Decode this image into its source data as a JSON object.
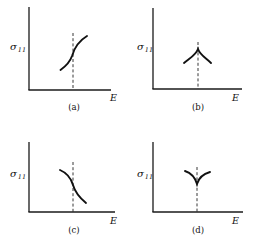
{
  "figure": {
    "panels": [
      {
        "id": "a",
        "caption": "(a)",
        "ylabel_symbol": "σ",
        "ylabel_sub": "11",
        "xlabel": "E",
        "shape": "monotonic increasing S-curve with inflection at dashed line"
      },
      {
        "id": "b",
        "caption": "(b)",
        "ylabel_symbol": "σ",
        "ylabel_sub": "11",
        "xlabel": "E",
        "shape": "peaked cusp (maximum) at dashed line"
      },
      {
        "id": "c",
        "caption": "(c)",
        "ylabel_symbol": "σ",
        "ylabel_sub": "11",
        "xlabel": "E",
        "shape": "monotonic decreasing S-curve with inflection at dashed line"
      },
      {
        "id": "d",
        "caption": "(d)",
        "ylabel_symbol": "σ",
        "ylabel_sub": "11",
        "xlabel": "E",
        "shape": "V-shaped cusp (minimum) at dashed line"
      }
    ]
  }
}
